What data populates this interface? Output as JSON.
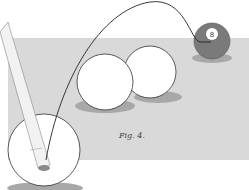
{
  "figure": {
    "caption": "Fig. 4.",
    "eight_ball_label": "8",
    "colors": {
      "table": "#d9d9d9",
      "shadow": "#a8a8a8",
      "ball": "#ffffff",
      "eight_ball": "#7a7a7a",
      "outline": "#333333"
    }
  }
}
